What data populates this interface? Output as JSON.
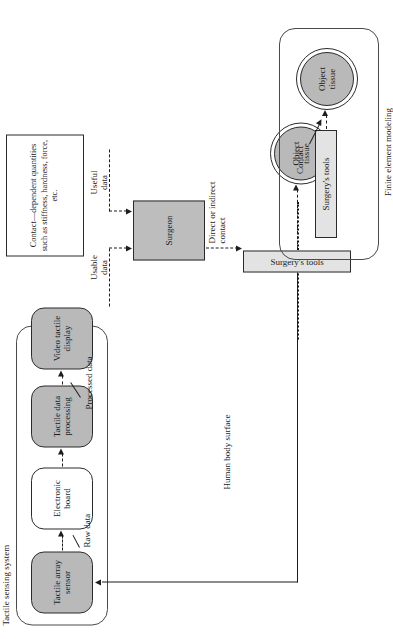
{
  "figure": {
    "kind": "flowchart",
    "orientation": "rotated-90-ccw",
    "background": "#ffffff"
  },
  "groups": {
    "tactile_sensing_system": {
      "label": "Tactile sensing system"
    },
    "finite_element_modeling": {
      "label": "Finite element modeling"
    }
  },
  "nodes": {
    "tactile_array_sensor": {
      "label": "Tactile array\nsensor",
      "line1": "Tactile array",
      "line2": "sensor",
      "fill": "#b9b9b9"
    },
    "electronic_board": {
      "label": "Electronic\nboard",
      "line1": "Electronic",
      "line2": "board",
      "fill": "#ffffff"
    },
    "tactile_data_processing": {
      "label": "Tactile data\nprocessing",
      "line1": "Tactile data",
      "line2": "processing",
      "fill": "#b9b9b9"
    },
    "video_tactile_display": {
      "label": "Video tactile\ndisplay",
      "line1": "Video tactile",
      "line2": "display",
      "fill": "#b9b9b9"
    },
    "surgeon": {
      "label": "Surgeon",
      "fill": "#bdbdbd"
    },
    "surgery_tools_body": {
      "label": "Surgery's tools",
      "fill": "#e3e3e3"
    },
    "surgery_tools_fem": {
      "label": "Surgery's tools",
      "fill": "#e3e3e3"
    },
    "object_tissue_body": {
      "line1": "Object",
      "line2": "tissue",
      "fill": "#b9b9b9"
    },
    "object_tissue_fem": {
      "line1": "Object",
      "line2": "tissue",
      "fill": "#b9b9b9"
    }
  },
  "textbox": {
    "contact_quantities": "Contact—dependent quantities such as stiffness, hardness, force, etc."
  },
  "edge_labels": {
    "raw_data": "Raw data",
    "processed_data": "Processed data",
    "usable_data_l1": "Usable",
    "usable_data_l2": "data",
    "useful_data_l1": "Useful",
    "useful_data_l2": "data",
    "direct_or_l1": "Direct or",
    "direct_or_l2": "indirect contact",
    "contact": "Contact",
    "human_body_surface": "Human body surface"
  },
  "colors": {
    "shaded_node": "#b9b9b9",
    "light_bar": "#e3e3e3",
    "surgeon_fill": "#bdbdbd",
    "stroke": "#2b2b2b",
    "page": "#ffffff"
  }
}
